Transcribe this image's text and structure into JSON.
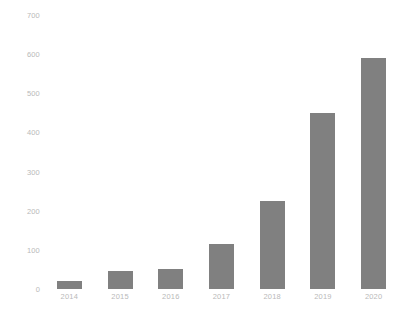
{
  "chart_data": {
    "type": "bar",
    "title": "",
    "subtitle": "",
    "xlabel": "",
    "ylabel": "",
    "categories": [
      "2014",
      "2015",
      "2016",
      "2017",
      "2018",
      "2019",
      "2020"
    ],
    "values": [
      20,
      45,
      50,
      115,
      225,
      450,
      590
    ],
    "ylim": [
      0,
      700
    ],
    "ytick_values": [
      0,
      100,
      200,
      300,
      400,
      500,
      600,
      700
    ],
    "ytick_labels": [
      "0",
      "100",
      "200",
      "300",
      "400",
      "500",
      "600",
      "700"
    ],
    "grid": false,
    "legend": null,
    "legend_position": "none",
    "bar_color": "#808080",
    "background_color": "#ffffff",
    "tick_label_color": "#b9b9b9",
    "annotations": []
  }
}
